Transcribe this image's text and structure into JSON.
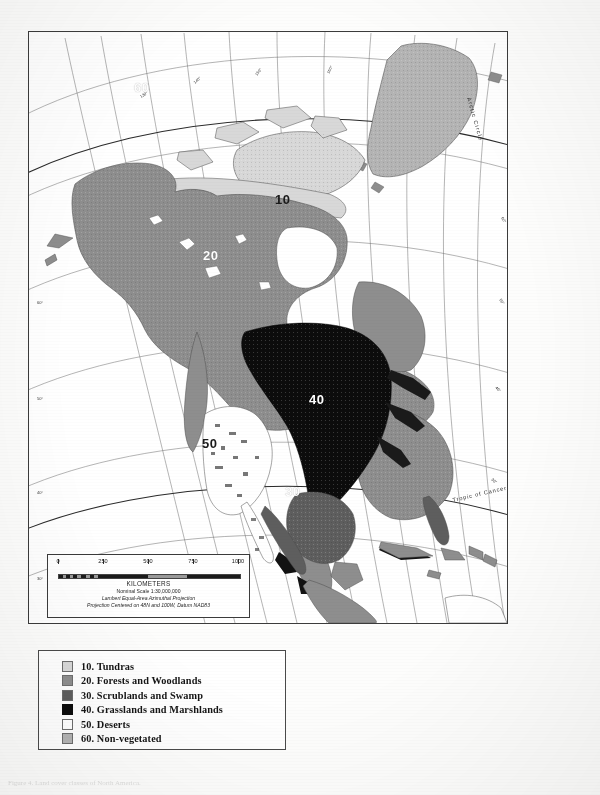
{
  "document": {
    "type": "land-cover-map",
    "region": "North America"
  },
  "map": {
    "frame_label": "north-america-land-cover-map",
    "zone_labels": [
      {
        "id": "60",
        "text": "60",
        "style": "white",
        "x": 389,
        "y": 89,
        "region": "Greenland"
      },
      {
        "id": "10",
        "text": "10",
        "style": "black",
        "x": 277,
        "y": 196,
        "region": "Canadian Arctic"
      },
      {
        "id": "20",
        "text": "20",
        "style": "white",
        "x": 206,
        "y": 251,
        "region": "Boreal Canada"
      },
      {
        "id": "40",
        "text": "40",
        "style": "white",
        "x": 311,
        "y": 397,
        "region": "Great Plains"
      },
      {
        "id": "50",
        "text": "50",
        "style": "black",
        "x": 205,
        "y": 440,
        "region": "Southwest US"
      },
      {
        "id": "30",
        "text": "30",
        "style": "white",
        "x": 289,
        "y": 489,
        "region": "Texas / Northern Mexico"
      }
    ],
    "annotations": [
      {
        "name": "arctic-circle-label",
        "text": "Arctic Circle",
        "x": 455,
        "y": 72,
        "rotate": 72
      },
      {
        "name": "tropic-of-cancer-label",
        "text": "Tropic of Cancer",
        "x": 463,
        "y": 475,
        "rotate": -12
      }
    ],
    "graticule": {
      "latitude_labels": [
        "70°",
        "60°",
        "50°",
        "40°",
        "30°",
        "20°"
      ],
      "longitude_labels": [
        "160°",
        "150°",
        "140°",
        "130°",
        "120°",
        "110°",
        "100°",
        "90°",
        "80°",
        "70°",
        "60°",
        "50°",
        "40°"
      ],
      "visible": true
    }
  },
  "scale": {
    "title": "KILOMETERS",
    "ticks": [
      "0",
      "250",
      "500",
      "750",
      "1000"
    ],
    "nominal_scale": "Nominal Scale 1:30,000,000",
    "projection": "Lambert Equal-Area Azimuthal Projection",
    "projection_center": "Projection Centered on 48N and 100W, Datum NAD83"
  },
  "legend": {
    "items": [
      {
        "code": "10.",
        "label": "Tundras",
        "text": "10.  Tundras",
        "color": "#d8d8d8"
      },
      {
        "code": "20.",
        "label": "Forests and Woodlands",
        "text": "20.  Forests and Woodlands",
        "color": "#8e8e8e"
      },
      {
        "code": "30.",
        "label": "Scrublands and Swamp",
        "text": "30.  Scrublands and Swamp",
        "color": "#5e5e5e"
      },
      {
        "code": "40.",
        "label": "Grasslands and Marshlands",
        "text": "40.  Grasslands and Marshlands",
        "color": "#0c0c0c"
      },
      {
        "code": "50.",
        "label": "Deserts",
        "text": "50.  Deserts",
        "color": "#ffffff"
      },
      {
        "code": "60.",
        "label": "Non-vegetated",
        "text": "60.  Non-vegetated",
        "color": "#b4b4b4"
      }
    ]
  },
  "bottom_caption": {
    "text": "Figure 4. Land cover classes of North America."
  }
}
